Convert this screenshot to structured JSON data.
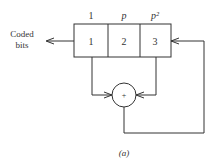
{
  "diagram": {
    "output_label_line1": "Coded",
    "output_label_line2": "bits",
    "register_headers": [
      "1",
      "p",
      "p²"
    ],
    "cells": [
      "1",
      "2",
      "3"
    ],
    "adder_symbol": "+",
    "caption": "(a)",
    "line_color": "#333333"
  }
}
